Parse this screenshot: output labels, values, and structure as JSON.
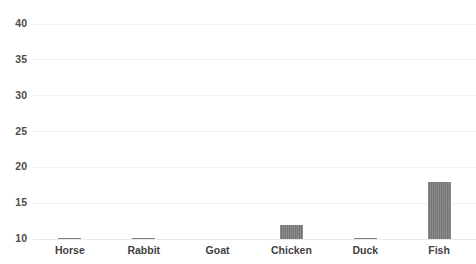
{
  "chart_data": {
    "type": "bar",
    "title": "",
    "xlabel": "",
    "ylabel": "",
    "categories": [
      "Horse",
      "Rabbit",
      "Goat",
      "Chicken",
      "Duck",
      "Fish"
    ],
    "values": [
      10.1,
      10.1,
      10,
      12,
      10.1,
      18
    ],
    "ylim": [
      10,
      40
    ],
    "yticks": [
      10,
      15,
      20,
      25,
      30,
      35,
      40
    ],
    "ytick_labels": [
      "10",
      "15",
      "20",
      "25",
      "30",
      "35",
      "40"
    ],
    "grid": true,
    "legend": false,
    "bar_color": "#757575",
    "gridline_color": "#f0f0f0",
    "axis_text_color": "#4c4c4c",
    "background_color": "#ffffff"
  }
}
